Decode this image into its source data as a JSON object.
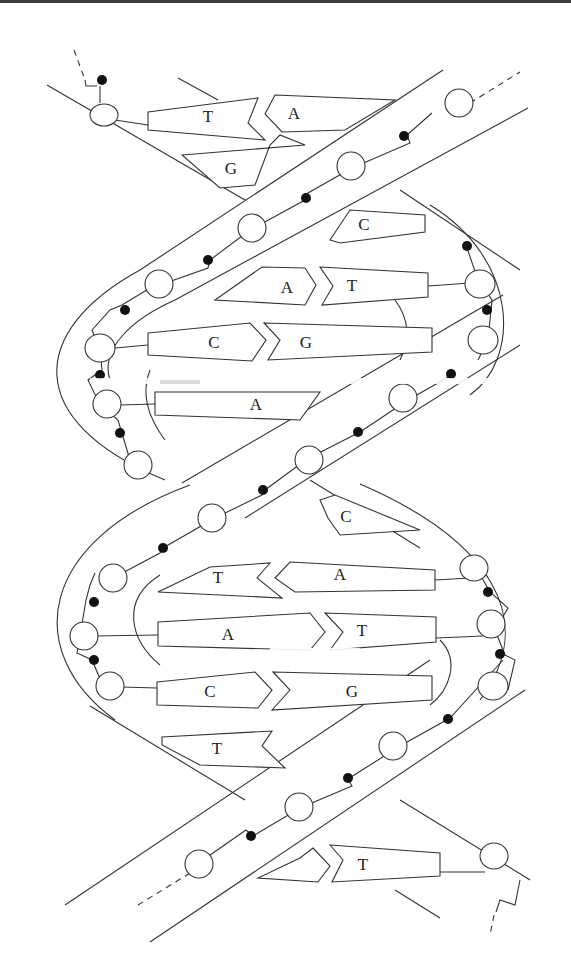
{
  "diagram": {
    "legend_implied": {
      "open_circle": "sugar",
      "filled_dot": "phosphate",
      "pentagon": "nitrogenous base"
    },
    "base_pairs": [
      {
        "left": "T",
        "right": "A"
      },
      {
        "left": "G",
        "right": ""
      },
      {
        "left": "",
        "right": "C"
      },
      {
        "left": "A",
        "right": "T"
      },
      {
        "left": "C",
        "right": "G"
      },
      {
        "left": "A",
        "right": ""
      },
      {
        "left": "",
        "right": "C"
      },
      {
        "left": "T",
        "right": "A"
      },
      {
        "left": "A",
        "right": "T"
      },
      {
        "left": "C",
        "right": "G"
      },
      {
        "left": "T",
        "right": ""
      },
      {
        "left": "",
        "right": "T"
      }
    ]
  },
  "labels": {
    "bp1_left": "T",
    "bp1_right": "A",
    "bp2_left": "G",
    "bp3_right": "C",
    "bp4_left": "A",
    "bp4_right": "T",
    "bp5_left": "C",
    "bp5_right": "G",
    "bp6_left": "A",
    "bp7_right": "C",
    "bp8_left": "T",
    "bp8_right": "A",
    "bp9_left": "A",
    "bp9_right": "T",
    "bp10_left": "C",
    "bp10_right": "G",
    "bp11_left": "T",
    "bp12_right": "T"
  }
}
